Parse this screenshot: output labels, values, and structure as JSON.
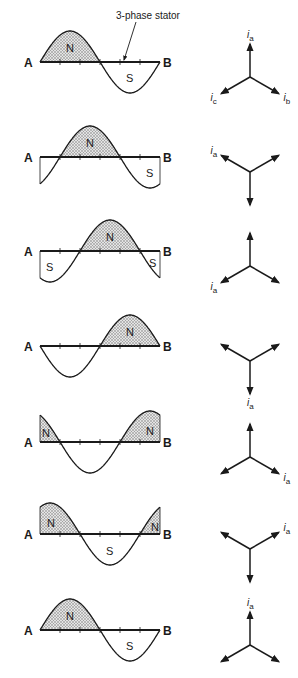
{
  "figure": {
    "annotation": "3-phase stator",
    "end_label_left": "A",
    "end_label_right": "B",
    "north_label": "N",
    "south_label": "S",
    "current_symbol": "i",
    "current_subscripts": {
      "a": "a",
      "b": "b",
      "c": "c"
    },
    "colors": {
      "ink": "#1a1a1a",
      "shade": "#bdbdbd",
      "background": "#ffffff"
    }
  },
  "panels": [
    {
      "index": 1,
      "baseline_y": 62,
      "phase_deg": 0,
      "ia_angle_deg": 90,
      "labels": [
        "ia",
        "ib",
        "ic"
      ],
      "poles": [
        {
          "label": "N",
          "x": 70,
          "dy": -14
        },
        {
          "label": "S",
          "x": 130,
          "dy": 16
        }
      ]
    },
    {
      "index": 2,
      "baseline_y": 157,
      "phase_deg": 60,
      "ia_angle_deg": 150,
      "labels": [
        "ia"
      ],
      "poles": [
        {
          "label": "N",
          "x": 90,
          "dy": -14
        },
        {
          "label": "S",
          "x": 150,
          "dy": 16
        }
      ]
    },
    {
      "index": 3,
      "baseline_y": 251,
      "phase_deg": 120,
      "ia_angle_deg": 210,
      "labels": [
        "ia"
      ],
      "poles": [
        {
          "label": "S",
          "x": 50,
          "dy": 16
        },
        {
          "label": "N",
          "x": 110,
          "dy": -14
        },
        {
          "label": "S",
          "x": 153,
          "dy": 12
        }
      ]
    },
    {
      "index": 4,
      "baseline_y": 346,
      "phase_deg": 180,
      "ia_angle_deg": 270,
      "labels": [
        "ia"
      ],
      "poles": [
        {
          "label": "N",
          "x": 130,
          "dy": -14
        }
      ]
    },
    {
      "index": 5,
      "baseline_y": 442,
      "phase_deg": 240,
      "ia_angle_deg": 330,
      "labels": [
        "ia"
      ],
      "poles": [
        {
          "label": "N",
          "x": 46,
          "dy": -9
        },
        {
          "label": "N",
          "x": 150,
          "dy": -11
        }
      ]
    },
    {
      "index": 6,
      "baseline_y": 534,
      "phase_deg": 300,
      "ia_angle_deg": 30,
      "labels": [
        "ia"
      ],
      "poles": [
        {
          "label": "N",
          "x": 51,
          "dy": -11
        },
        {
          "label": "S",
          "x": 110,
          "dy": 17
        },
        {
          "label": "N",
          "x": 155,
          "dy": -7
        }
      ]
    },
    {
      "index": 7,
      "baseline_y": 630,
      "phase_deg": 0,
      "ia_angle_deg": 90,
      "labels": [
        "ia"
      ],
      "poles": [
        {
          "label": "N",
          "x": 70,
          "dy": -14
        },
        {
          "label": "S",
          "x": 130,
          "dy": 16
        }
      ]
    }
  ],
  "geometry": {
    "wave_x_start": 40,
    "wave_x_end": 160,
    "amplitude": 31,
    "tick_spacing": 20,
    "phasor_center_x": 250,
    "phasor_center_offset_y": 15,
    "phasor_length": 33
  }
}
